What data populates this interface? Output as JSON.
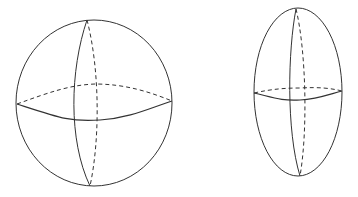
{
  "diagram": {
    "stroke_color": "#333333",
    "background": "#ffffff",
    "shapes": [
      {
        "name": "sphere",
        "outline": {
          "cx": 94,
          "cy": 103,
          "rx": 78,
          "ry": 83
        },
        "meridian_front": "M87,20 C70,70 68,140 90,186",
        "meridian_back": "M87,20 C100,70 100,140 90,186",
        "equator_front": "M17,104 C60,118 70,122 100,120 C130,118 150,108 172,101",
        "equator_back": "M17,104 C50,92 70,85 95,84 C125,84 150,92 172,101"
      },
      {
        "name": "prolate-ellipsoid",
        "outline": {
          "cx": 298,
          "cy": 92,
          "rx": 44,
          "ry": 84
        },
        "meridian_front": "M296,9 C288,50 286,130 300,176",
        "meridian_back": "M296,9 C306,50 308,130 300,176",
        "equator_front": "M254,93 C275,98 282,101 300,100 C318,99 330,94 342,91",
        "equator_back": "M254,93 C272,89 285,88 300,88 C318,87 330,88 342,91"
      }
    ]
  }
}
